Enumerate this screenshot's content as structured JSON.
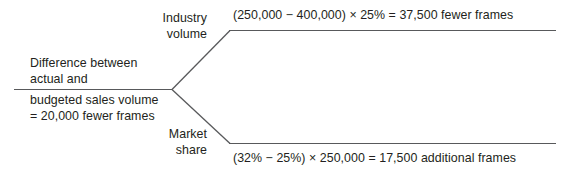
{
  "diagram": {
    "type": "variance-breakdown-tree",
    "trunk": {
      "label_above_line_1": "Difference between",
      "label_above_line_2": "actual and",
      "label_below_line_1": "budgeted sales volume",
      "label_below_line_2": "= 20,000 fewer frames"
    },
    "branches": [
      {
        "id": "industry-volume",
        "name_line_1": "Industry",
        "name_line_2": "volume",
        "formula": "(250,000 − 400,000) × 25% = 37,500 fewer frames"
      },
      {
        "id": "market-share",
        "name_line_1": "Market",
        "name_line_2": "share",
        "formula": "(32% − 25%) × 250,000 = 17,500 additional frames"
      }
    ],
    "colors": {
      "line": "#58595b",
      "text": "#231f20",
      "background": "#ffffff"
    }
  }
}
